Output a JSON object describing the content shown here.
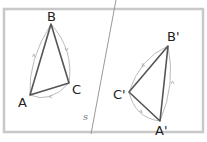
{
  "diagram": {
    "mirror_line_label": "s",
    "original": {
      "vertices": [
        {
          "name": "A",
          "label": "A"
        },
        {
          "name": "B",
          "label": "B"
        },
        {
          "name": "C",
          "label": "C"
        }
      ],
      "orientation": "clockwise"
    },
    "image": {
      "vertices": [
        {
          "name": "A'",
          "label": "A'"
        },
        {
          "name": "B'",
          "label": "B'"
        },
        {
          "name": "C'",
          "label": "C'"
        }
      ],
      "orientation": "counterclockwise"
    },
    "colors": {
      "frame": "#c8c8c8",
      "triangle": "#555555",
      "arrow_arc": "#aaaaaa",
      "mirror_line": "#999999"
    }
  }
}
